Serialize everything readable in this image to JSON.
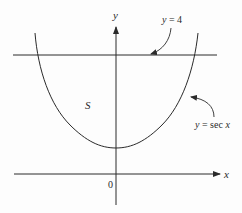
{
  "figure": {
    "type": "function-plot",
    "axes": {
      "x_label": "x",
      "y_label": "y",
      "origin_label": "0"
    },
    "curves": [
      {
        "name": "secant",
        "label": "y = sec x",
        "label_parts": {
          "lhs": "y",
          "eq": " = sec ",
          "var": "x"
        }
      },
      {
        "name": "horizontal-line",
        "label": "y = 4",
        "label_parts": {
          "lhs": "y",
          "eq": " = 4"
        }
      }
    ],
    "region": {
      "label": "S"
    },
    "colors": {
      "stroke": "#2a2a2a",
      "background": "#fdfdfd"
    }
  }
}
